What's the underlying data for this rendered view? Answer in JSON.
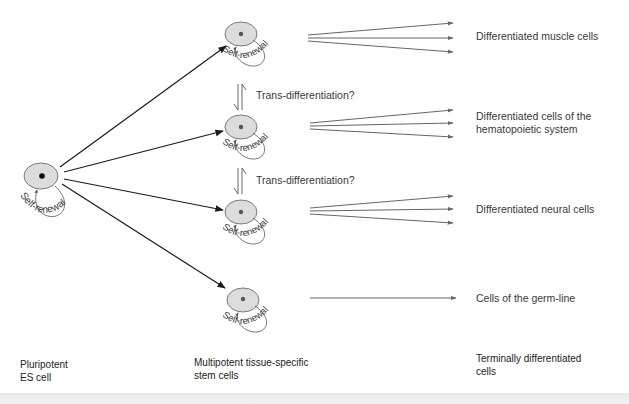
{
  "diagram": {
    "colors": {
      "cell_fill": "#dcdcdc",
      "cell_stroke": "#7a7a7a",
      "nucleus": "#111111",
      "nucleus_small": "#555555",
      "arrow_dark": "#1a1a1a",
      "arrow_gray": "#666666",
      "text": "#3a3a3a"
    },
    "pluripotent_cell": {
      "self_renewal_label": "Self-renewal"
    },
    "multipotent_cells": [
      {
        "id": "muscle-progenitor",
        "self_renewal_label": "Self-renewal",
        "target_label": "Differentiated muscle cells",
        "fan_arrows": 3
      },
      {
        "id": "hematopoietic-progenitor",
        "self_renewal_label": "Self-renewal",
        "target_label": "Differentiated cells of the\nhematopoietic system",
        "fan_arrows": 3
      },
      {
        "id": "neural-progenitor",
        "self_renewal_label": "Self-renewal",
        "target_label": "Differentiated neural cells",
        "fan_arrows": 3
      },
      {
        "id": "germline-progenitor",
        "self_renewal_label": "Self-renewal",
        "target_label": "Cells of the germ-line",
        "fan_arrows": 1
      }
    ],
    "trans_differentiation": [
      {
        "label": "Trans-differentiation?"
      },
      {
        "label": "Trans-differentiation?"
      }
    ],
    "column_labels": {
      "left": "Pluripotent\nES cell",
      "middle": "Multipotent tissue-specific\nstem cells",
      "right": "Terminally differentiated\ncells"
    }
  }
}
